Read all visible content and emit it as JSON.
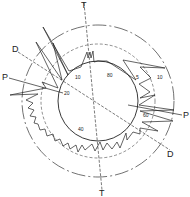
{
  "diagram": {
    "type": "polar-orientation-rose",
    "colors": {
      "line": "#222222",
      "background": "#ffffff"
    },
    "axes": [
      {
        "name": "T",
        "label_start": "T",
        "label_end": "T"
      },
      {
        "name": "P",
        "label_start": "P",
        "label_end": "P"
      },
      {
        "name": "D",
        "label_start": "D",
        "label_end": "D"
      }
    ],
    "ring_labels": [
      "10",
      "80",
      "20",
      "5",
      "10",
      "60",
      "40"
    ],
    "circles": [
      {
        "name": "inner",
        "style": "solid"
      },
      {
        "name": "middle",
        "style": "dashed"
      },
      {
        "name": "outer",
        "style": "dash-dot"
      }
    ]
  }
}
